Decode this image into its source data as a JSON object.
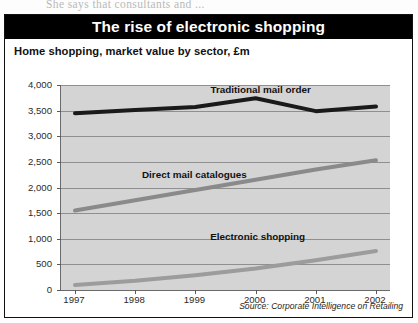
{
  "page_bleed_text": "She says that consultants and ...",
  "figure": {
    "title": "The rise of electronic shopping",
    "subtitle": "Home shopping, market value by sector, £m",
    "source": "Source: Corporate Intelligence on Retailing"
  },
  "colors": {
    "banner_background": "#000000",
    "banner_text": "#ffffff",
    "plot_background": "#d4d4d4",
    "gridline": "#8f8f8f",
    "traditional_mail_order": "#1a1a1a",
    "direct_mail_catalogues": "#8a8a8a",
    "electronic_shopping": "#9c9c9c"
  },
  "chart_data": {
    "type": "line",
    "title": "The rise of electronic shopping",
    "subtitle": "Home shopping, market value by sector, £m",
    "xlabel": "",
    "ylabel": "£m",
    "categories": [
      "1997",
      "1998",
      "1999",
      "2000",
      "2001",
      "2002"
    ],
    "x": [
      1997,
      1998,
      1999,
      2000,
      2001,
      2002
    ],
    "ylim": [
      0,
      4000
    ],
    "yticks": [
      0,
      500,
      1000,
      1500,
      2000,
      2500,
      3000,
      3500,
      4000
    ],
    "ytick_labels": [
      "0",
      "500",
      "1,000",
      "1,500",
      "2,000",
      "2,500",
      "3,000",
      "3,500",
      "4,000"
    ],
    "grid": true,
    "legend": "inline-labels",
    "series": [
      {
        "name": "Traditional mail order",
        "color": "#1a1a1a",
        "values": [
          3450,
          3510,
          3570,
          3740,
          3490,
          3580
        ],
        "label_x": 2000.1,
        "label_y": 3900
      },
      {
        "name": "Direct mail catalogues",
        "color": "#8a8a8a",
        "values": [
          1550,
          1750,
          1950,
          2150,
          2350,
          2530
        ],
        "label_x": 1999.0,
        "label_y": 2240
      },
      {
        "name": "Electronic shopping",
        "color": "#9c9c9c",
        "values": [
          100,
          180,
          290,
          420,
          580,
          760
        ],
        "label_x": 2000.05,
        "label_y": 1030
      }
    ],
    "annotations": [
      {
        "text": "Source: Corporate Intelligence on Retailing",
        "position": "bottom-right"
      }
    ]
  }
}
